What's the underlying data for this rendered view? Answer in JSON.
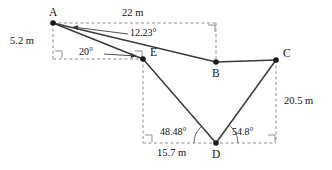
{
  "diagram": {
    "type": "geometry-figure",
    "colors": {
      "solid_line": "#3a3a3a",
      "dashed_line": "#8e8e8e",
      "vertex": "#1a1a1a",
      "text": "#111111",
      "background": "#ffffff"
    },
    "points": [
      {
        "id": "A",
        "label": "A",
        "x": 53,
        "y": 23,
        "label_dx": -4,
        "label_dy": -16
      },
      {
        "id": "E",
        "label": "E",
        "x": 143,
        "y": 59,
        "label_dx": 7,
        "label_dy": -12
      },
      {
        "id": "B",
        "label": "B",
        "x": 216,
        "y": 62,
        "label_dx": -4,
        "label_dy": 6
      },
      {
        "id": "C",
        "label": "C",
        "x": 276,
        "y": 60,
        "label_dx": 7,
        "label_dy": -12
      },
      {
        "id": "D",
        "label": "D",
        "x": 216,
        "y": 143,
        "label_dx": -4,
        "label_dy": 6
      }
    ],
    "solid_segments": [
      {
        "name": "segment-A-E",
        "from": "A",
        "to": "E"
      },
      {
        "name": "segment-A-B",
        "from": "A",
        "to": "B"
      },
      {
        "name": "segment-B-C",
        "from": "B",
        "to": "C"
      },
      {
        "name": "segment-E-D",
        "from": "E",
        "to": "D"
      },
      {
        "name": "segment-D-C",
        "from": "D",
        "to": "C"
      }
    ],
    "dashed_segments": [
      {
        "name": "dashed-top-horizontal",
        "x1": 53,
        "y1": 23,
        "x2": 216,
        "y2": 23
      },
      {
        "name": "dashed-left-vertical",
        "x1": 53,
        "y1": 23,
        "x2": 53,
        "y2": 59
      },
      {
        "name": "dashed-mid-horizontal",
        "x1": 53,
        "y1": 59,
        "x2": 143,
        "y2": 59
      },
      {
        "name": "dashed-b-vertical",
        "x1": 216,
        "y1": 23,
        "x2": 216,
        "y2": 62
      },
      {
        "name": "dashed-e-vertical",
        "x1": 143,
        "y1": 59,
        "x2": 143,
        "y2": 143
      },
      {
        "name": "dashed-bottom-horizontal",
        "x1": 143,
        "y1": 143,
        "x2": 276,
        "y2": 143
      },
      {
        "name": "dashed-c-vertical",
        "x1": 276,
        "y1": 60,
        "x2": 276,
        "y2": 143
      }
    ],
    "right_angle_markers": [
      {
        "name": "right-angle-marker-below-A",
        "x": 55,
        "y": 51,
        "dir_x": 1,
        "dir_y": 1
      },
      {
        "name": "right-angle-marker-at-E-dashed",
        "x": 135,
        "y": 51,
        "dir_x": 1,
        "dir_y": 1
      },
      {
        "name": "right-angle-marker-top-right",
        "x": 208,
        "y": 25,
        "dir_x": 1,
        "dir_y": 1
      },
      {
        "name": "right-angle-marker-bottom-left",
        "x": 145,
        "y": 135,
        "dir_x": 1,
        "dir_y": 1
      },
      {
        "name": "right-angle-marker-bottom-right",
        "x": 268,
        "y": 135,
        "dir_x": 1,
        "dir_y": 1
      }
    ],
    "leaders": [
      {
        "name": "leader-12-23",
        "x1": 128,
        "y1": 34,
        "x2": 73,
        "y2": 27,
        "arrow": "left"
      },
      {
        "name": "leader-20",
        "x1": 104,
        "y1": 54,
        "x2": 136,
        "y2": 56,
        "arrow": "right"
      }
    ],
    "angle_arcs": [
      {
        "name": "arc-angle-at-D-left",
        "cx": 216,
        "cy": 143,
        "r": 22,
        "start_deg": 180,
        "end_deg": 228
      },
      {
        "name": "arc-angle-at-D-right",
        "cx": 216,
        "cy": 143,
        "r": 22,
        "start_deg": 305,
        "end_deg": 360
      }
    ],
    "measurement_labels": [
      {
        "name": "label-length-22m",
        "text": "22 m",
        "x": 122,
        "y": 8,
        "kind": "meas"
      },
      {
        "name": "label-length-5-2m",
        "text": "5.2 m",
        "x": 10,
        "y": 36,
        "kind": "meas"
      },
      {
        "name": "label-length-20-5m",
        "text": "20.5 m",
        "x": 284,
        "y": 96,
        "kind": "meas"
      },
      {
        "name": "label-length-15-7m",
        "text": "15.7 m",
        "x": 157,
        "y": 148,
        "kind": "meas"
      }
    ],
    "angle_labels": [
      {
        "name": "label-angle-12-23",
        "text": "12.23°",
        "x": 130,
        "y": 28,
        "kind": "ang"
      },
      {
        "name": "label-angle-20",
        "text": "20°",
        "x": 79,
        "y": 47,
        "kind": "ang"
      },
      {
        "name": "label-angle-48-48",
        "text": "48.48°",
        "x": 160,
        "y": 127,
        "kind": "ang"
      },
      {
        "name": "label-angle-54-8",
        "text": "54.8°",
        "x": 232,
        "y": 127,
        "kind": "ang"
      }
    ]
  }
}
